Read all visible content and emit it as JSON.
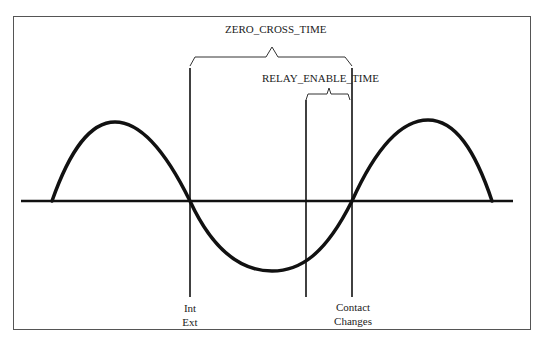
{
  "diagram": {
    "labels": {
      "zero_cross_time": "ZERO_CROSS_TIME",
      "relay_enable_time": "RELAY_ENABLE_TIME",
      "int": "Int",
      "ext": "Ext",
      "contact": "Contact",
      "changes": "Changes"
    },
    "colors": {
      "stroke": "#111111",
      "frame": "#555555",
      "background": "#ffffff"
    }
  }
}
